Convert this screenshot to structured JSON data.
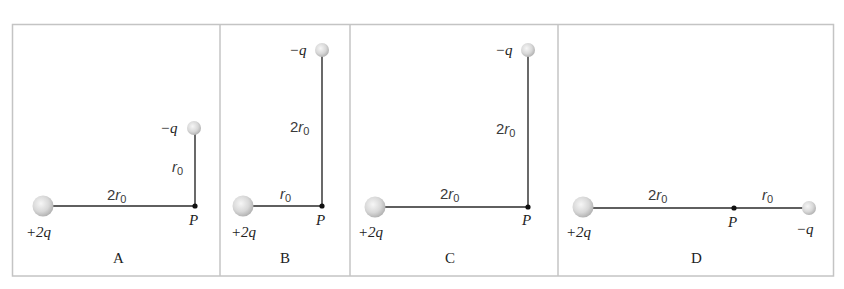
{
  "figure": {
    "panels": [
      {
        "label": "A",
        "charge1": "+2q",
        "charge2": "−q",
        "point": "P",
        "dist_horizontal": {
          "coef": "2",
          "sym": "r",
          "sub": "0"
        },
        "dist_vertical": {
          "coef": "",
          "sym": "r",
          "sub": "0"
        }
      },
      {
        "label": "B",
        "charge1": "+2q",
        "charge2": "−q",
        "point": "P",
        "dist_horizontal": {
          "coef": "",
          "sym": "r",
          "sub": "0"
        },
        "dist_vertical": {
          "coef": "2",
          "sym": "r",
          "sub": "0"
        }
      },
      {
        "label": "C",
        "charge1": "+2q",
        "charge2": "−q",
        "point": "P",
        "dist_horizontal": {
          "coef": "2",
          "sym": "r",
          "sub": "0"
        },
        "dist_vertical": {
          "coef": "2",
          "sym": "r",
          "sub": "0"
        }
      },
      {
        "label": "D",
        "charge1": "+2q",
        "charge2": "−q",
        "point": "P",
        "dist_left": {
          "coef": "2",
          "sym": "r",
          "sub": "0"
        },
        "dist_right": {
          "coef": "",
          "sym": "r",
          "sub": "0"
        }
      }
    ],
    "colors": {
      "frame": "#c4c4c4",
      "line": "#2a2a2a",
      "sphere_light": "#f4f4f4",
      "sphere_dark": "#b8b8b8"
    }
  }
}
